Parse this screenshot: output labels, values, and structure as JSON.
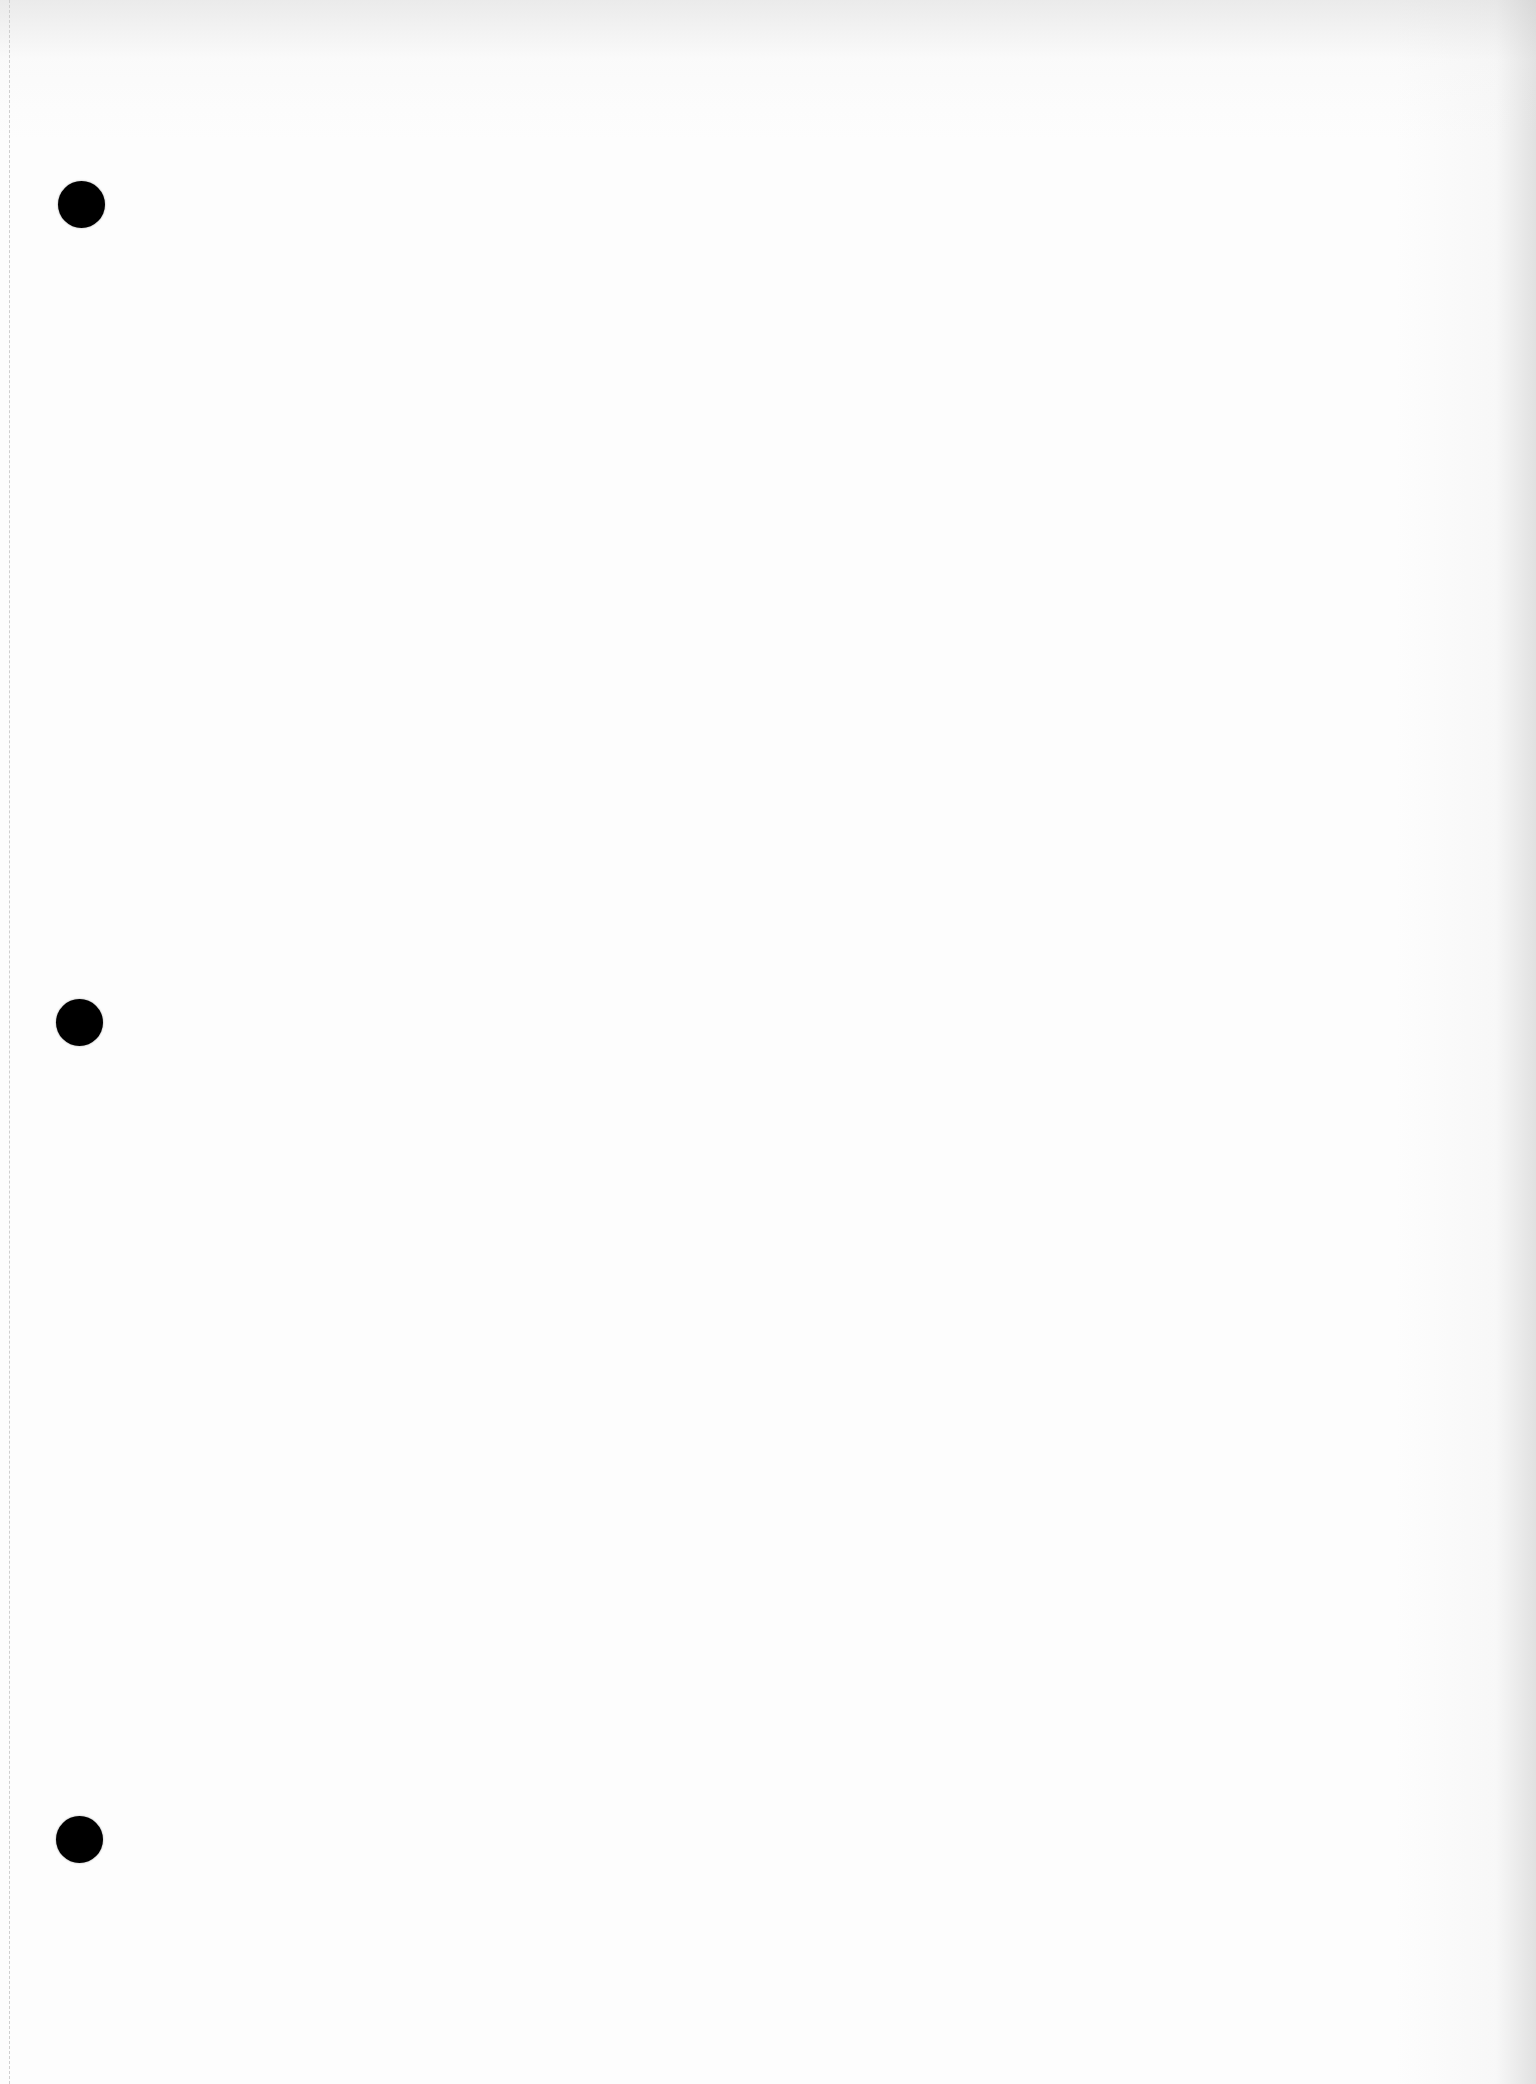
{
  "page": {
    "type": "blank three-hole-punched sheet",
    "background_color": "#fdfdfd",
    "text": ""
  },
  "punch_holes": [
    {
      "cx": 82,
      "cy": 205,
      "diameter": 47,
      "color": "#000000"
    },
    {
      "cx": 80,
      "cy": 1023,
      "diameter": 47,
      "color": "#000000"
    },
    {
      "cx": 80,
      "cy": 1840,
      "diameter": 47,
      "color": "#000000"
    }
  ],
  "perforation": {
    "x": 9,
    "style": "dashed",
    "color": "#cfcfcf"
  }
}
